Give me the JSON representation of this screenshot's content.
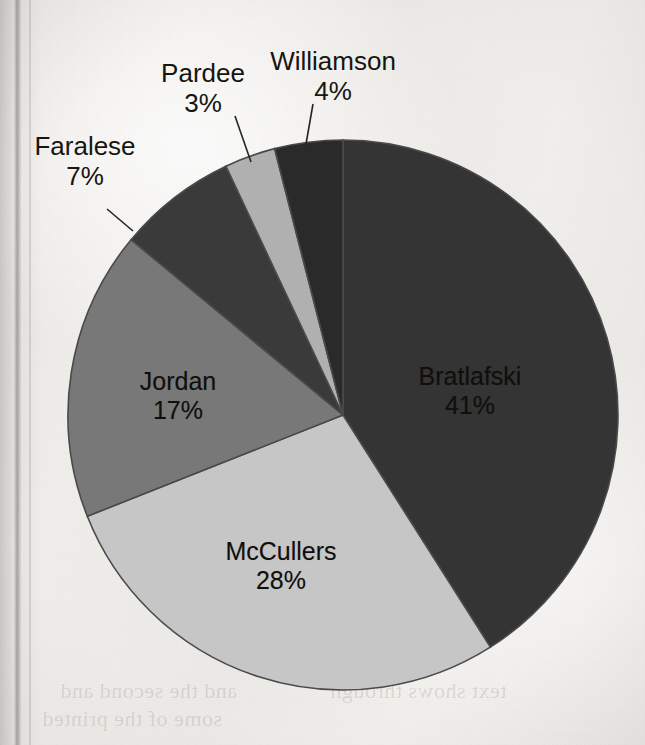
{
  "chart_data": {
    "type": "pie",
    "title": "",
    "subtitle": "",
    "xlabel": "",
    "ylabel": "",
    "legend_position": "none",
    "grid": false,
    "unit": "%",
    "start_angle_deg": 0,
    "direction": "clockwise",
    "categories": [
      "Bratlafski",
      "McCullers",
      "Jordan",
      "Faralese",
      "Pardee",
      "Williamson"
    ],
    "values": [
      41,
      28,
      17,
      7,
      3,
      4
    ],
    "slices": [
      {
        "name": "Bratlafski",
        "value": 41,
        "label": "Bratlafski",
        "pct_label": "41%",
        "color": "#343434",
        "label_placement": "inside",
        "label_x": 470,
        "label_y": 362,
        "text_color": "#100f0b"
      },
      {
        "name": "McCullers",
        "value": 28,
        "label": "McCullers",
        "pct_label": "28%",
        "color": "#c6c6c6",
        "label_placement": "inside",
        "label_x": 281,
        "label_y": 537,
        "text_color": "#100f0b"
      },
      {
        "name": "Jordan",
        "value": 17,
        "label": "Jordan",
        "pct_label": "17%",
        "color": "#787878",
        "label_placement": "inside",
        "label_x": 178,
        "label_y": 367,
        "text_color": "#100f0b"
      },
      {
        "name": "Faralese",
        "value": 7,
        "label": "Faralese",
        "pct_label": "7%",
        "color": "#3a3a3a",
        "label_placement": "outside",
        "label_x": 85,
        "label_y": 131,
        "text_color": "#17150f",
        "leader": {
          "x1": 107,
          "y1": 209,
          "x2": 133,
          "y2": 231
        }
      },
      {
        "name": "Pardee",
        "value": 3,
        "label": "Pardee",
        "pct_label": "3%",
        "color": "#b0b0b0",
        "label_placement": "outside",
        "label_x": 203,
        "label_y": 58,
        "text_color": "#17150f",
        "leader": {
          "x1": 235,
          "y1": 116,
          "x2": 251,
          "y2": 162
        }
      },
      {
        "name": "Williamson",
        "value": 4,
        "label": "Williamson",
        "pct_label": "4%",
        "color": "#2a2a2a",
        "label_placement": "outside",
        "label_x": 333,
        "label_y": 46,
        "text_color": "#17150f",
        "leader": {
          "x1": 313,
          "y1": 104,
          "x2": 306,
          "y2": 144
        }
      }
    ],
    "geometry": {
      "center_x": 343,
      "center_y": 415,
      "radius": 275
    }
  },
  "page": {
    "background_color": "#edebe7",
    "outline_color": "#4a4a4a",
    "bleed_text": [
      "and the second and",
      "some of the printed",
      "text shows through"
    ]
  }
}
